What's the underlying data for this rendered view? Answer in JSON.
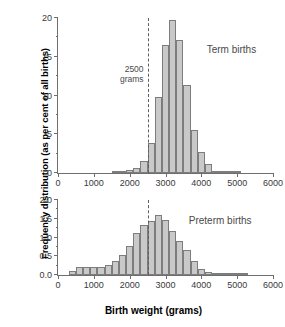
{
  "axis_titles": {
    "y": "Frequency distribution (as per cent of all births)",
    "x": "Birth weight (grams)"
  },
  "annotation": {
    "line1": "2500",
    "line2": "grams",
    "value": 2500
  },
  "colors": {
    "bar_fill": "#c9c9c9",
    "bar_stroke": "#7d7d7d",
    "axis": "#6e6e6e",
    "text": "#3a3a3a",
    "marker_line": "#5f5f5f"
  },
  "chart_data": [
    {
      "type": "bar",
      "title": "Term births",
      "xlabel": "Birth weight (grams)",
      "ylabel": "Frequency distribution (as per cent of all births)",
      "xlim": [
        0,
        6000
      ],
      "ylim": [
        0,
        20
      ],
      "xticks": [
        0,
        1000,
        2000,
        3000,
        4000,
        5000,
        6000
      ],
      "xtick_labels": [
        "0",
        "1000",
        "2000",
        "3000",
        "4000",
        "5000",
        "6000"
      ],
      "yticks": [
        0,
        5,
        10,
        15,
        20
      ],
      "ytick_labels": [
        "0",
        "5",
        "10",
        "15",
        "20"
      ],
      "yminorticks": [
        2.5,
        7.5,
        12.5,
        17.5
      ],
      "grid": false,
      "bin_width": 200,
      "bin_starts": [
        1500,
        1700,
        1900,
        2100,
        2300,
        2500,
        2700,
        2900,
        3100,
        3300,
        3500,
        3700,
        3900,
        4100,
        4300,
        4500,
        4700,
        4900
      ],
      "categories": [
        "1500-1700",
        "1700-1900",
        "1900-2100",
        "2100-2300",
        "2300-2500",
        "2500-2700",
        "2700-2900",
        "2900-3100",
        "3100-3300",
        "3300-3500",
        "3500-3700",
        "3700-3900",
        "3900-4100",
        "4100-4300",
        "4300-4500",
        "4500-4700",
        "4700-4900",
        "4900-5100"
      ],
      "values": [
        0.2,
        0.25,
        0.4,
        0.6,
        1.6,
        3.9,
        9.8,
        16.5,
        19.8,
        17.2,
        11.4,
        5.6,
        2.7,
        1.1,
        0.3,
        0.15,
        0.1,
        0.05
      ],
      "annotations": [
        {
          "text": "2500 grams",
          "x": 2500,
          "type": "vline-dashed"
        },
        {
          "text": "Term births",
          "x": 4150,
          "y": 15.2,
          "type": "series-label"
        }
      ]
    },
    {
      "type": "bar",
      "title": "Preterm births",
      "xlabel": "Birth weight (grams)",
      "ylabel": "Frequency distribution (as per cent of all births)",
      "xlim": [
        0,
        6000
      ],
      "ylim": [
        0,
        2.0
      ],
      "xticks": [
        0,
        1000,
        2000,
        3000,
        4000,
        5000,
        6000
      ],
      "xtick_labels": [
        "0",
        "1000",
        "2000",
        "3000",
        "4000",
        "5000",
        "6000"
      ],
      "yticks": [
        0.0,
        0.5,
        1.0,
        1.5,
        2.0
      ],
      "ytick_labels": [
        "0.0",
        "0.5",
        "1.0",
        "1.5",
        "2.0"
      ],
      "yminorticks": [
        0.25,
        0.75,
        1.25,
        1.75
      ],
      "grid": false,
      "bin_width": 200,
      "bin_starts": [
        300,
        500,
        700,
        900,
        1100,
        1300,
        1500,
        1700,
        1900,
        2100,
        2300,
        2500,
        2700,
        2900,
        3100,
        3300,
        3500,
        3700,
        3900,
        4100,
        4300,
        4500,
        4700,
        4900,
        5100
      ],
      "categories": [
        "300-500",
        "500-700",
        "700-900",
        "900-1100",
        "1100-1300",
        "1300-1500",
        "1500-1700",
        "1700-1900",
        "1900-2100",
        "2100-2300",
        "2300-2500",
        "2500-2700",
        "2700-2900",
        "2900-3100",
        "3100-3300",
        "3300-3500",
        "3500-3700",
        "3700-3900",
        "3900-4100",
        "4100-4300",
        "4300-4500",
        "4500-4700",
        "4700-4900",
        "4900-5100",
        "5100-5300"
      ],
      "values": [
        0.12,
        0.22,
        0.22,
        0.22,
        0.22,
        0.26,
        0.37,
        0.54,
        0.77,
        1.12,
        1.33,
        1.45,
        1.6,
        1.48,
        1.18,
        0.9,
        0.67,
        0.37,
        0.15,
        0.09,
        0.05,
        0.04,
        0.03,
        0.03,
        0.02
      ],
      "annotations": [
        {
          "text": "2500 grams",
          "x": 2500,
          "type": "vline-dashed"
        },
        {
          "text": "Preterm births",
          "x": 3650,
          "y": 1.3,
          "type": "series-label"
        }
      ]
    }
  ]
}
